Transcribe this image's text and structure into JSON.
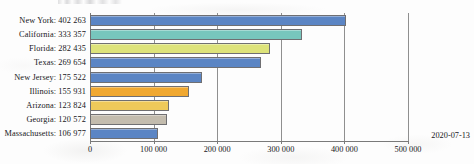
{
  "chart_data": {
    "type": "bar",
    "orientation": "horizontal",
    "title": "",
    "xlabel": "",
    "ylabel": "",
    "xlim": [
      0,
      500000
    ],
    "grid": true,
    "legend": false,
    "xticks": [
      "0",
      "100 000",
      "200 000",
      "300 000",
      "400 000",
      "500 000"
    ],
    "xtick_values": [
      0,
      100000,
      200000,
      300000,
      400000,
      500000
    ],
    "categories": [
      "New York",
      "California",
      "Florida",
      "Texas",
      "New Jersey",
      "Illinois",
      "Arizona",
      "Georgia",
      "Massachusetts"
    ],
    "values": [
      402263,
      333357,
      282435,
      269654,
      175522,
      155931,
      123824,
      120572,
      106977
    ],
    "value_labels": [
      "402 263",
      "333 357",
      "282 435",
      "269 654",
      "175 522",
      "155 931",
      "123 824",
      "120 572",
      "106 977"
    ],
    "category_labels": [
      "New York: 402 263",
      "California: 333 357",
      "Florida: 282 435",
      "Texas: 269 654",
      "New Jersey: 175 522",
      "Illinois: 155 931",
      "Arizona: 123 824",
      "Georgia: 120 572",
      "Massachusetts: 106 977"
    ],
    "bar_colors": [
      "#5b85c4",
      "#77c6bd",
      "#dde37a",
      "#5b85c4",
      "#5b85c4",
      "#f0a830",
      "#eec95a",
      "#c3bcae",
      "#5b85c4"
    ],
    "bar_border_color": "#6f6f72"
  },
  "annotations": {
    "date_stamp": "2020-07-13"
  }
}
